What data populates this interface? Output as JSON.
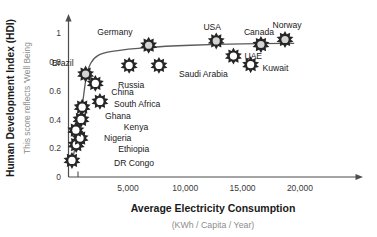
{
  "chart_data": {
    "type": "scatter",
    "title": "",
    "xlabel": "Average Electricity Consumption",
    "xlabel_sub": "(KWh / Capita / Year)",
    "ylabel": "Human Development Index (HDI)",
    "ylabel_sub": "This score reflects 'Well Being",
    "xlim": [
      0,
      22500
    ],
    "ylim": [
      0,
      1.08
    ],
    "xticks": [
      "5,000",
      "10,000",
      "15,000",
      "20,000"
    ],
    "xtick_values": [
      5000,
      10000,
      15000,
      20000
    ],
    "yticks": [
      "0",
      "0.2",
      "0.4",
      "0.6",
      "0.8",
      "1"
    ],
    "ytick_values": [
      0,
      0.2,
      0.4,
      0.6,
      0.8,
      1
    ],
    "grid": false,
    "legend": "none",
    "points": [
      {
        "name": "DR Congo",
        "x": 110,
        "y": 0.115,
        "fill": "white",
        "label_dx": 42,
        "label_dy": 3,
        "anchor": "start"
      },
      {
        "name": "Ethiopia",
        "x": 480,
        "y": 0.225,
        "fill": "white",
        "label_dx": 42,
        "label_dy": 4,
        "anchor": "start"
      },
      {
        "name": "Nigeria",
        "x": 820,
        "y": 0.27,
        "fill": "white",
        "label_dx": 24,
        "label_dy": 0,
        "anchor": "start"
      },
      {
        "name": "Kenya",
        "x": 450,
        "y": 0.325,
        "fill": "white",
        "label_dx": 48,
        "label_dy": -3,
        "anchor": "start"
      },
      {
        "name": "Ghana",
        "x": 900,
        "y": 0.4,
        "fill": "white",
        "label_dx": 24,
        "label_dy": -3,
        "anchor": "start"
      },
      {
        "name": "",
        "x": 1000,
        "y": 0.485,
        "fill": "white",
        "label_dx": 0,
        "label_dy": 0,
        "anchor": "start"
      },
      {
        "name": "China",
        "x": 2150,
        "y": 0.65,
        "fill": "white",
        "label_dx": 16,
        "label_dy": 9,
        "anchor": "start"
      },
      {
        "name": "Brazil",
        "x": 1300,
        "y": 0.715,
        "fill": "light",
        "label_dx": -12,
        "label_dy": -11,
        "anchor": "end"
      },
      {
        "name": "South Africa",
        "x": 2550,
        "y": 0.525,
        "fill": "white",
        "label_dx": 14,
        "label_dy": 3,
        "anchor": "start"
      },
      {
        "name": "Russia",
        "x": 5100,
        "y": 0.775,
        "fill": "white",
        "label_dx": 2,
        "label_dy": 20,
        "anchor": "middle"
      },
      {
        "name": "Germany",
        "x": 6800,
        "y": 0.915,
        "fill": "light",
        "label_dx": -16,
        "label_dy": -13,
        "anchor": "end"
      },
      {
        "name": "Saudi Arabia",
        "x": 7700,
        "y": 0.775,
        "fill": "white",
        "label_dx": 20,
        "label_dy": 9,
        "anchor": "start"
      },
      {
        "name": "USA",
        "x": 12700,
        "y": 0.945,
        "fill": "light",
        "label_dx": -4,
        "label_dy": -14,
        "anchor": "middle"
      },
      {
        "name": "UAE",
        "x": 14200,
        "y": 0.84,
        "fill": "white",
        "label_dx": 11,
        "label_dy": 0,
        "anchor": "start"
      },
      {
        "name": "Kuwait",
        "x": 15700,
        "y": 0.78,
        "fill": "white",
        "label_dx": 12,
        "label_dy": 3,
        "anchor": "start"
      },
      {
        "name": "Canada",
        "x": 16600,
        "y": 0.92,
        "fill": "light",
        "label_dx": -2,
        "label_dy": -13,
        "anchor": "middle"
      },
      {
        "name": "Norway",
        "x": 18700,
        "y": 0.955,
        "fill": "light",
        "label_dx": 2,
        "label_dy": -14,
        "anchor": "middle"
      }
    ],
    "trend_curve": [
      {
        "x": 120,
        "y": 0.1
      },
      {
        "x": 600,
        "y": 0.3
      },
      {
        "x": 1000,
        "y": 0.49
      },
      {
        "x": 1350,
        "y": 0.69
      },
      {
        "x": 1750,
        "y": 0.79
      },
      {
        "x": 2400,
        "y": 0.845
      },
      {
        "x": 3600,
        "y": 0.872
      },
      {
        "x": 6800,
        "y": 0.9
      },
      {
        "x": 10500,
        "y": 0.915
      },
      {
        "x": 15000,
        "y": 0.925
      },
      {
        "x": 19500,
        "y": 0.928
      }
    ]
  }
}
